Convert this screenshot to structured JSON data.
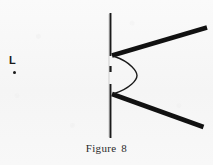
{
  "figure": {
    "caption_text": "Figure",
    "caption_number": "8",
    "source_label": "L",
    "source_point_name": "light-source-point",
    "colors": {
      "ink": "#1a1a1a",
      "paper": "#f7f7f7",
      "arc_stroke": "#1a1a1a"
    },
    "elements": {
      "barrier_line": "vertical-barrier-line",
      "slit_gap_upper": "slit-gap-upper",
      "slit_gap_lower": "slit-gap-lower",
      "wedge_arm_upper": "upper-wedge-arm",
      "wedge_arm_lower": "lower-wedge-arm",
      "wavefront_arc": "wavefront-arc"
    },
    "geometry": {
      "barrier_x": 110,
      "barrier_top_y": 13,
      "barrier_bottom_y": 138,
      "gap_upper": [
        56,
        66
      ],
      "gap_lower": [
        72,
        84
      ],
      "arm_vertex_upper": [
        113,
        55
      ],
      "arm_end_upper": [
        207,
        28
      ],
      "arm_vertex_lower": [
        113,
        94
      ],
      "arm_end_lower": [
        203,
        127
      ],
      "arc_start": [
        115,
        56
      ],
      "arc_peak_x": 135,
      "arc_end": [
        115,
        93
      ]
    }
  }
}
